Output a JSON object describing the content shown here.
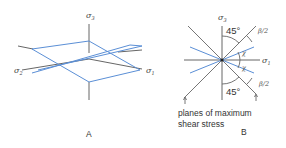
{
  "panel_a": {
    "caption": "A",
    "axis_labels": {
      "sigma3": {
        "symbol": "σ",
        "subscript": "3"
      },
      "sigma2": {
        "symbol": "σ",
        "subscript": "2"
      },
      "sigma1": {
        "symbol": "σ",
        "subscript": "1"
      }
    }
  },
  "panel_b": {
    "caption": "B",
    "axis_labels": {
      "sigma3": {
        "symbol": "σ",
        "subscript": "3"
      },
      "sigma1": {
        "symbol": "σ",
        "subscript": "1"
      }
    },
    "angle_top": "45°",
    "angle_bottom": "45°",
    "half_beta_top": "β/2",
    "half_beta_bottom": "β/2",
    "chi_top": "χ",
    "chi_bottom": "χ",
    "note_line1": "planes of maximum",
    "note_line2": "shear stress"
  },
  "colors": {
    "planes": "#5b8fd6",
    "axes": "#555555"
  }
}
